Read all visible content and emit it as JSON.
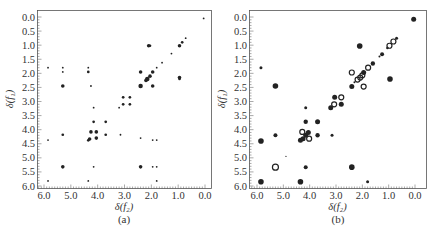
{
  "panels": [
    {
      "id": "a",
      "caption": "(a)",
      "xlabel": "δ(f₂)",
      "ylabel": "δ(f₁)",
      "frame": {
        "x0": 37,
        "x1": 211,
        "y0": 10,
        "y1": 188
      },
      "xmap": {
        "v0": 6.0,
        "p0": 44,
        "v1": 0.0,
        "p1": 205
      },
      "ymap": {
        "v0": 0.0,
        "p0": 17,
        "v1": 6.0,
        "p1": 186
      }
    },
    {
      "id": "b",
      "caption": "(b)",
      "xlabel": "δ(f₂)",
      "ylabel": "δ(f₁)",
      "frame": {
        "x0": 249,
        "x1": 426,
        "y0": 10,
        "y1": 188
      },
      "xmap": {
        "v0": 6.0,
        "p0": 257,
        "v1": 0.0,
        "p1": 415
      },
      "ymap": {
        "v0": 0.0,
        "p0": 17,
        "v1": 6.0,
        "p1": 186
      }
    }
  ],
  "chart_data": [
    {
      "type": "scatter",
      "title": "(a)",
      "xlabel": "δ(f2)",
      "ylabel": "δ(f1)",
      "xlim": [
        6.25,
        -0.2
      ],
      "ylim": [
        6.0,
        -0.25
      ],
      "x_ticks": [
        "6.0",
        "5.0",
        "4.0",
        "3.0",
        "2.0",
        "1.0",
        "0.0"
      ],
      "y_ticks": [
        "0.0",
        "0.5",
        "1.0",
        "1.5",
        "2.0",
        "2.5",
        "3.0",
        "3.5",
        "4.0",
        "4.5",
        "5.0",
        "5.5",
        "6.0"
      ],
      "grid": false,
      "description": "2D COSY NMR correlation map (experimental), small cross peaks",
      "points": [
        {
          "x": 0.05,
          "y": 0.05,
          "s": 1
        },
        {
          "x": 0.72,
          "y": 0.75,
          "s": 1
        },
        {
          "x": 0.85,
          "y": 0.9,
          "s": 1.5
        },
        {
          "x": 0.95,
          "y": 1.02,
          "s": 2
        },
        {
          "x": 2.1,
          "y": 1.02,
          "s": 2
        },
        {
          "x": 2.05,
          "y": 1.02,
          "s": 1.5
        },
        {
          "x": 1.25,
          "y": 1.3,
          "s": 1
        },
        {
          "x": 1.6,
          "y": 1.62,
          "s": 1
        },
        {
          "x": 1.8,
          "y": 1.8,
          "s": 1
        },
        {
          "x": 5.85,
          "y": 1.8,
          "s": 1
        },
        {
          "x": 5.3,
          "y": 1.8,
          "s": 1
        },
        {
          "x": 4.35,
          "y": 1.8,
          "s": 1
        },
        {
          "x": 5.3,
          "y": 1.95,
          "s": 1
        },
        {
          "x": 4.35,
          "y": 1.95,
          "s": 1.5
        },
        {
          "x": 2.4,
          "y": 1.95,
          "s": 2
        },
        {
          "x": 1.95,
          "y": 1.95,
          "s": 2
        },
        {
          "x": 2.05,
          "y": 2.1,
          "s": 2
        },
        {
          "x": 2.15,
          "y": 2.2,
          "s": 2.5
        },
        {
          "x": 2.2,
          "y": 2.25,
          "s": 2
        },
        {
          "x": 0.95,
          "y": 2.15,
          "s": 2
        },
        {
          "x": 0.95,
          "y": 2.2,
          "s": 1.5
        },
        {
          "x": 5.3,
          "y": 2.45,
          "s": 2
        },
        {
          "x": 4.25,
          "y": 2.45,
          "s": 1
        },
        {
          "x": 2.4,
          "y": 2.45,
          "s": 2.5
        },
        {
          "x": 1.95,
          "y": 2.45,
          "s": 2
        },
        {
          "x": 3.05,
          "y": 2.85,
          "s": 1.5
        },
        {
          "x": 2.8,
          "y": 2.85,
          "s": 1.5
        },
        {
          "x": 3.05,
          "y": 3.1,
          "s": 1.5
        },
        {
          "x": 2.8,
          "y": 3.1,
          "s": 1.5
        },
        {
          "x": 3.2,
          "y": 3.22,
          "s": 1
        },
        {
          "x": 4.15,
          "y": 3.22,
          "s": 1
        },
        {
          "x": 4.15,
          "y": 3.72,
          "s": 1.5
        },
        {
          "x": 3.7,
          "y": 3.72,
          "s": 1.5
        },
        {
          "x": 4.25,
          "y": 4.08,
          "s": 2
        },
        {
          "x": 4.05,
          "y": 4.08,
          "s": 2
        },
        {
          "x": 5.3,
          "y": 4.18,
          "s": 1.5
        },
        {
          "x": 3.7,
          "y": 4.18,
          "s": 1.5
        },
        {
          "x": 3.15,
          "y": 4.18,
          "s": 1
        },
        {
          "x": 4.05,
          "y": 4.3,
          "s": 2
        },
        {
          "x": 4.3,
          "y": 4.33,
          "s": 2
        },
        {
          "x": 4.35,
          "y": 4.38,
          "s": 1.5
        },
        {
          "x": 2.4,
          "y": 4.3,
          "s": 1
        },
        {
          "x": 5.85,
          "y": 4.37,
          "s": 1
        },
        {
          "x": 1.95,
          "y": 4.37,
          "s": 1
        },
        {
          "x": 1.8,
          "y": 4.37,
          "s": 1
        },
        {
          "x": 5.3,
          "y": 5.32,
          "s": 2
        },
        {
          "x": 4.15,
          "y": 5.32,
          "s": 1
        },
        {
          "x": 2.4,
          "y": 5.32,
          "s": 2
        },
        {
          "x": 1.95,
          "y": 5.32,
          "s": 1
        },
        {
          "x": 1.8,
          "y": 5.32,
          "s": 1
        },
        {
          "x": 5.85,
          "y": 5.82,
          "s": 1
        },
        {
          "x": 4.35,
          "y": 5.82,
          "s": 1
        },
        {
          "x": 1.8,
          "y": 5.82,
          "s": 1
        }
      ]
    },
    {
      "type": "scatter",
      "title": "(b)",
      "xlabel": "δ(f2)",
      "ylabel": "δ(f1)",
      "xlim": [
        6.25,
        -0.2
      ],
      "ylim": [
        6.0,
        -0.25
      ],
      "x_ticks": [
        "6.0",
        "5.0",
        "4.0",
        "3.0",
        "2.0",
        "1.0",
        "0.0"
      ],
      "y_ticks": [
        "0.0",
        "0.5",
        "1.0",
        "1.5",
        "2.0",
        "2.5",
        "3.0",
        "3.5",
        "4.0",
        "4.5",
        "5.0",
        "5.5",
        "6.0"
      ],
      "grid": false,
      "description": "2D COSY NMR correlation map (simulated/predicted), filled dots = peaks, open circles = alternate-phase peaks",
      "legend": [],
      "points": [
        {
          "x": 0.05,
          "y": 0.08,
          "r": 2.5,
          "style": "filled"
        },
        {
          "x": 0.7,
          "y": 0.75,
          "r": 1.5,
          "style": "filled"
        },
        {
          "x": 0.82,
          "y": 0.87,
          "r": 2.5,
          "style": "open"
        },
        {
          "x": 0.97,
          "y": 1.02,
          "r": 2.5,
          "style": "open"
        },
        {
          "x": 1.05,
          "y": 1.1,
          "r": 1.2,
          "style": "filled"
        },
        {
          "x": 2.1,
          "y": 1.03,
          "r": 2.8,
          "style": "filled"
        },
        {
          "x": 1.25,
          "y": 1.32,
          "r": 2,
          "style": "filled"
        },
        {
          "x": 1.35,
          "y": 1.4,
          "r": 1,
          "style": "filled"
        },
        {
          "x": 1.6,
          "y": 1.65,
          "r": 2.2,
          "style": "filled"
        },
        {
          "x": 1.78,
          "y": 1.8,
          "r": 2.5,
          "style": "open"
        },
        {
          "x": 5.85,
          "y": 1.8,
          "r": 1.5,
          "style": "filled"
        },
        {
          "x": 2.4,
          "y": 1.97,
          "r": 2.5,
          "style": "open"
        },
        {
          "x": 1.95,
          "y": 1.97,
          "r": 2.5,
          "style": "filled"
        },
        {
          "x": 2.0,
          "y": 2.07,
          "r": 2.5,
          "style": "open"
        },
        {
          "x": 2.08,
          "y": 2.15,
          "r": 2.5,
          "style": "open"
        },
        {
          "x": 2.18,
          "y": 2.22,
          "r": 2.5,
          "style": "open"
        },
        {
          "x": 2.3,
          "y": 2.32,
          "r": 1,
          "style": "filled"
        },
        {
          "x": 0.95,
          "y": 2.2,
          "r": 2.8,
          "style": "filled"
        },
        {
          "x": 5.3,
          "y": 2.45,
          "r": 2.8,
          "style": "filled"
        },
        {
          "x": 2.4,
          "y": 2.47,
          "r": 2.5,
          "style": "filled"
        },
        {
          "x": 1.95,
          "y": 2.47,
          "r": 2.5,
          "style": "open"
        },
        {
          "x": 3.05,
          "y": 2.85,
          "r": 2.5,
          "style": "filled"
        },
        {
          "x": 2.8,
          "y": 2.85,
          "r": 2.5,
          "style": "open"
        },
        {
          "x": 3.07,
          "y": 3.1,
          "r": 2.5,
          "style": "open"
        },
        {
          "x": 2.8,
          "y": 3.1,
          "r": 2.5,
          "style": "filled"
        },
        {
          "x": 3.2,
          "y": 3.22,
          "r": 2.5,
          "style": "filled"
        },
        {
          "x": 4.15,
          "y": 3.22,
          "r": 1.5,
          "style": "filled"
        },
        {
          "x": 4.15,
          "y": 3.72,
          "r": 2.2,
          "style": "filled"
        },
        {
          "x": 3.7,
          "y": 3.72,
          "r": 2.5,
          "style": "filled"
        },
        {
          "x": 4.28,
          "y": 4.08,
          "r": 2.5,
          "style": "open"
        },
        {
          "x": 4.05,
          "y": 4.1,
          "r": 2.5,
          "style": "filled"
        },
        {
          "x": 4.15,
          "y": 4.2,
          "r": 2.5,
          "style": "filled"
        },
        {
          "x": 5.3,
          "y": 4.2,
          "r": 2,
          "style": "filled"
        },
        {
          "x": 3.7,
          "y": 4.2,
          "r": 2.2,
          "style": "filled"
        },
        {
          "x": 3.15,
          "y": 4.2,
          "r": 1.5,
          "style": "filled"
        },
        {
          "x": 4.25,
          "y": 4.32,
          "r": 2.5,
          "style": "filled"
        },
        {
          "x": 4.02,
          "y": 4.32,
          "r": 2.5,
          "style": "open"
        },
        {
          "x": 4.35,
          "y": 4.38,
          "r": 2.5,
          "style": "filled"
        },
        {
          "x": 5.85,
          "y": 4.4,
          "r": 2.8,
          "style": "filled"
        },
        {
          "x": 4.9,
          "y": 4.95,
          "r": 0.6,
          "style": "filled"
        },
        {
          "x": 5.3,
          "y": 5.33,
          "r": 3,
          "style": "open"
        },
        {
          "x": 4.15,
          "y": 5.33,
          "r": 2,
          "style": "filled"
        },
        {
          "x": 2.4,
          "y": 5.33,
          "r": 2.8,
          "style": "filled"
        },
        {
          "x": 5.85,
          "y": 5.85,
          "r": 2.8,
          "style": "filled"
        },
        {
          "x": 4.35,
          "y": 5.85,
          "r": 2.8,
          "style": "filled"
        },
        {
          "x": 1.8,
          "y": 5.85,
          "r": 1.5,
          "style": "filled"
        }
      ]
    }
  ]
}
